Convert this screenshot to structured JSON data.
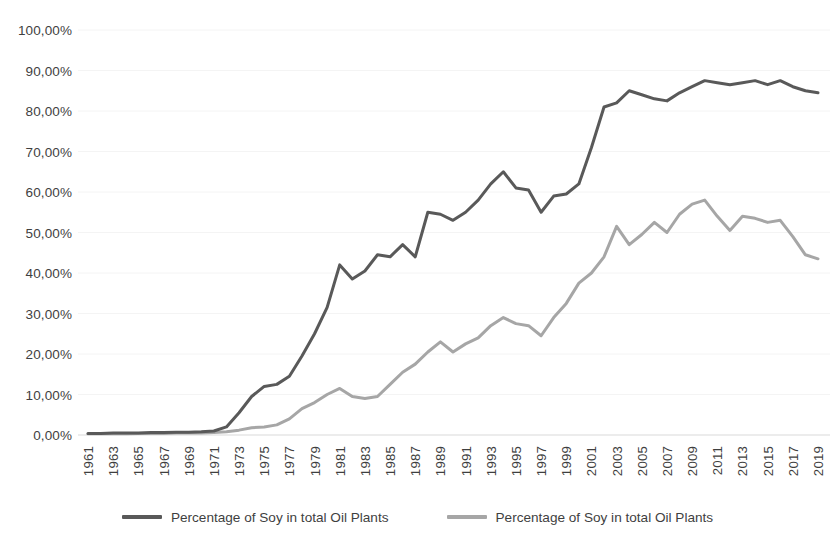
{
  "chart_data": {
    "type": "line",
    "title": "",
    "subtitle": "",
    "xlabel": "",
    "ylabel": "",
    "xlim": [
      1961,
      2019
    ],
    "ylim": [
      0,
      1.0
    ],
    "grid": false,
    "legend_position": "bottom",
    "y_tick_labels": [
      "100,00%",
      "90,00%",
      "80,00%",
      "70,00%",
      "60,00%",
      "50,00%",
      "40,00%",
      "30,00%",
      "20,00%",
      "10,00%",
      "0,00%"
    ],
    "y_tick_values": [
      100,
      90,
      80,
      70,
      60,
      50,
      40,
      30,
      20,
      10,
      0
    ],
    "x": [
      1961,
      1962,
      1963,
      1964,
      1965,
      1966,
      1967,
      1968,
      1969,
      1970,
      1971,
      1972,
      1973,
      1974,
      1975,
      1976,
      1977,
      1978,
      1979,
      1980,
      1981,
      1982,
      1983,
      1984,
      1985,
      1986,
      1987,
      1988,
      1989,
      1990,
      1991,
      1992,
      1993,
      1994,
      1995,
      1996,
      1997,
      1998,
      1999,
      2000,
      2001,
      2002,
      2003,
      2004,
      2005,
      2006,
      2007,
      2008,
      2009,
      2010,
      2011,
      2012,
      2013,
      2014,
      2015,
      2016,
      2017,
      2018,
      2019
    ],
    "x_tick_labels": [
      "1961",
      "1963",
      "1965",
      "1967",
      "1969",
      "1971",
      "1973",
      "1975",
      "1977",
      "1979",
      "1981",
      "1983",
      "1985",
      "1987",
      "1989",
      "1991",
      "1993",
      "1995",
      "1997",
      "1999",
      "2001",
      "2003",
      "2005",
      "2007",
      "2009",
      "2011",
      "2013",
      "2015",
      "2017",
      "2019"
    ],
    "series": [
      {
        "name": "Percentage of Soy in total Oil Plants",
        "color": "#595959",
        "line_width": 3.0,
        "values": [
          0.4,
          0.4,
          0.5,
          0.5,
          0.5,
          0.6,
          0.6,
          0.7,
          0.7,
          0.8,
          1.0,
          2.0,
          5.5,
          9.5,
          12.0,
          12.5,
          14.5,
          19.5,
          25.0,
          31.5,
          42.0,
          38.5,
          40.5,
          44.5,
          44.0,
          47.0,
          44.0,
          55.0,
          54.5,
          53.0,
          55.0,
          58.0,
          62.0,
          65.0,
          61.0,
          60.5,
          55.0,
          59.0,
          59.5,
          62.0,
          71.0,
          81.0,
          82.0,
          85.0,
          84.0,
          83.0,
          82.5,
          84.5,
          86.0,
          87.5,
          87.0,
          86.5,
          87.0,
          87.5,
          86.5,
          87.5,
          86.0,
          85.0,
          84.5
        ]
      },
      {
        "name": "Percentage of Soy in total Oil Plants",
        "color": "#A6A6A6",
        "line_width": 3.0,
        "values": [
          0.3,
          0.3,
          0.3,
          0.3,
          0.4,
          0.4,
          0.4,
          0.5,
          0.5,
          0.5,
          0.6,
          0.8,
          1.2,
          1.8,
          2.0,
          2.5,
          4.0,
          6.5,
          8.0,
          10.0,
          11.5,
          9.5,
          9.0,
          9.5,
          12.5,
          15.5,
          17.5,
          20.5,
          23.0,
          20.5,
          22.5,
          24.0,
          27.0,
          29.0,
          27.5,
          27.0,
          24.5,
          29.0,
          32.5,
          37.5,
          40.0,
          44.0,
          51.5,
          47.0,
          49.5,
          52.5,
          50.0,
          54.5,
          57.0,
          58.0,
          54.0,
          50.5,
          54.0,
          53.5,
          52.5,
          53.0,
          49.0,
          44.5,
          43.5
        ]
      }
    ]
  },
  "legend": {
    "items": [
      {
        "label": "Percentage of Soy in total Oil Plants",
        "color": "#595959"
      },
      {
        "label": "Percentage of Soy in total Oil Plants",
        "color": "#A6A6A6"
      }
    ]
  }
}
